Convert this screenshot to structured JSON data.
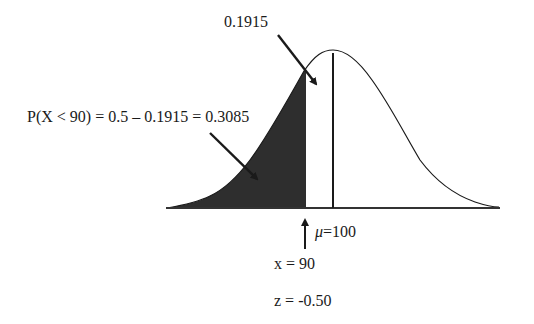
{
  "diagram": {
    "type": "normal-distribution-area",
    "labels": {
      "middle_area": "0.1915",
      "left_tail_area": "P(X < 90) = 0.5 – 0.1915 = 0.3085",
      "mean_symbol": "μ",
      "mean_value": "=100",
      "x_value": "x = 90",
      "z_value": "z = -0.50"
    },
    "colors": {
      "shaded": "#2e2e2e",
      "curve": "#1a1a1a",
      "background": "#ffffff"
    },
    "parameters": {
      "mean": 100,
      "x": 90,
      "z": -0.5,
      "area_between_x_and_mean": 0.1915,
      "area_left_of_x": 0.3085
    }
  }
}
